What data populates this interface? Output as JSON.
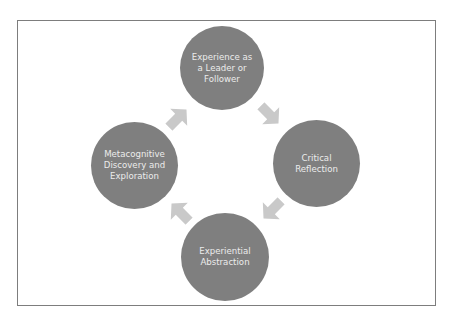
{
  "diagram": {
    "type": "cycle",
    "colors": {
      "node_fill": "#7f7f7f",
      "node_text": "#ececec",
      "arrow_fill": "#c9c9c9",
      "frame_border": "#7d7d7d"
    },
    "nodes": [
      {
        "id": "top",
        "label": "Experience as a Leader or Follower"
      },
      {
        "id": "right",
        "label": "Critical Reflection"
      },
      {
        "id": "bottom",
        "label": "Experiential Abstraction"
      },
      {
        "id": "left",
        "label": "Metacognitive Discovery and Exploration"
      }
    ],
    "arrows": [
      {
        "from": "top",
        "to": "right",
        "icon": "arrow-down-right-icon"
      },
      {
        "from": "right",
        "to": "bottom",
        "icon": "arrow-down-left-icon"
      },
      {
        "from": "bottom",
        "to": "left",
        "icon": "arrow-up-left-icon"
      },
      {
        "from": "left",
        "to": "top",
        "icon": "arrow-up-right-icon"
      }
    ]
  }
}
